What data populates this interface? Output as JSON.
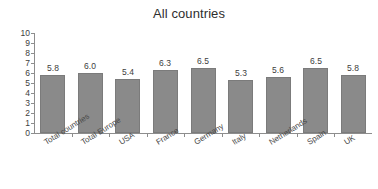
{
  "chart_data": {
    "type": "bar",
    "title": "All countries",
    "xlabel": "",
    "ylabel": "",
    "ylim": [
      0,
      10
    ],
    "ytick_step": 1,
    "yticks": [
      "10",
      "9",
      "8",
      "7",
      "6",
      "5",
      "4",
      "3",
      "2",
      "1",
      "0"
    ],
    "grid": false,
    "legend": "none",
    "bar_color": "#8a8a8a",
    "bar_border_color": "#7b7b7b",
    "axis_color": "#8d8d8d",
    "text_color": "#3d3d3d",
    "categories": [
      "Total countries",
      "Total Europe",
      "USA",
      "France",
      "Germany",
      "Italy",
      "Netherlands",
      "Spain",
      "UK"
    ],
    "values": [
      5.8,
      6.0,
      5.4,
      6.3,
      6.5,
      5.3,
      5.6,
      6.5,
      5.8
    ],
    "value_labels": [
      "5.8",
      "6.0",
      "5.4",
      "6.3",
      "6.5",
      "5.3",
      "5.6",
      "6.5",
      "5.8"
    ]
  }
}
